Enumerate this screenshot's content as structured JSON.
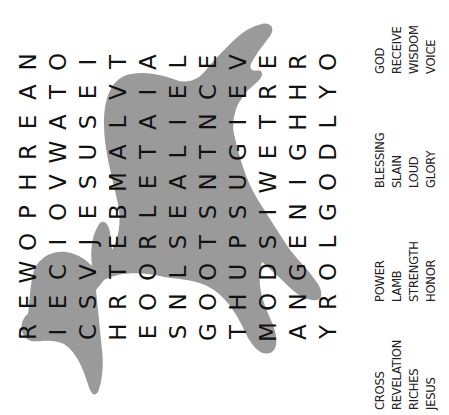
{
  "puzzle": {
    "theme_image": "lamb-silhouette",
    "grid_rows": [
      "NOITALEVERO",
      "ATEVIECERHY",
      "EASLAINITHL",
      "RWUATLTGEGD",
      "HVSMEANUWIO",
      "POEBLESSING",
      "OIJERSTPSEL",
      "WCVTOLOUDGO",
      "EESRONOHONR",
      "RICHESGTMAY"
    ],
    "orientation": "rotated-90-ccw",
    "silhouette_color": "#9a9a9a",
    "letter_color": "#111111"
  },
  "word_list": {
    "groups": [
      [
        "CROSS",
        "REVELATION",
        "RICHES",
        "JESUS"
      ],
      [
        "POWER",
        "LAMB",
        "STRENGTH",
        "HONOR"
      ],
      [
        "BLESSING",
        "SLAIN",
        "LOUD",
        "GLORY"
      ],
      [
        "GOD",
        "RECEIVE",
        "WISDOM",
        "VOICE"
      ]
    ]
  }
}
